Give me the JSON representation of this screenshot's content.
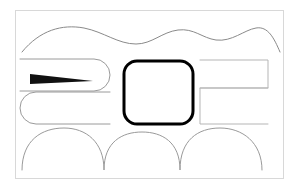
{
  "document": {
    "title": "Abstract Line Art Illustration",
    "width": 298,
    "height": 187,
    "background_color": "#ffffff"
  },
  "frame": {
    "name": "outer-border",
    "x": 15,
    "y": 10,
    "width": 268,
    "height": 168,
    "stroke_color": "#d8d8d8",
    "stroke_width": 1,
    "fill": "none"
  },
  "palette": {
    "thin_line": "#7a7a7a",
    "light_line": "#c9c9c9",
    "bold_line": "#000000",
    "solid_fill": "#111111",
    "frame": "#d8d8d8",
    "page": "#ffffff"
  },
  "shapes": [
    {
      "id": "top-wave",
      "label": "top wavy line",
      "type": "path",
      "stroke": "#8a8a8a",
      "stroke_width": 1,
      "fill": "none",
      "d": "M 22 52 C 40 30 62 24 84 28 C 104 32 118 44 136 44 C 152 44 162 32 178 30 C 194 28 202 38 216 40 C 232 42 244 30 256 28 C 268 26 274 38 280 52"
    },
    {
      "id": "left-upper-stadium",
      "label": "upper left rounded bar",
      "type": "path",
      "stroke": "#9a9a9a",
      "stroke_width": 1,
      "fill": "none",
      "d": "M 20 59 L 94 59 A 16 16 0 0 1 94 91 L 20 91"
    },
    {
      "id": "left-lower-stadium",
      "label": "lower left rounded bar",
      "type": "path",
      "stroke": "#9a9a9a",
      "stroke_width": 1,
      "fill": "none",
      "d": "M 110 92 L 36 92 A 16 16 0 0 0 36 124 L 110 124"
    },
    {
      "id": "black-wedge",
      "label": "solid black tapered wedge pointing right",
      "type": "polygon",
      "fill": "#111111",
      "stroke": "none",
      "points": "30,74 30,84 93,81"
    },
    {
      "id": "center-rounded-rect",
      "label": "central bold rounded rectangle",
      "type": "rounded-rect",
      "x": 124,
      "y": 61,
      "width": 69,
      "height": 63,
      "rx": 13,
      "stroke": "#000000",
      "stroke_width": 3,
      "fill": "#ffffff"
    },
    {
      "id": "right-upper-bracket",
      "label": "upper right rectangular bracket",
      "type": "path",
      "stroke": "#b5b5b5",
      "stroke_width": 1,
      "fill": "none",
      "d": "M 200 60 L 268 60 L 268 88 L 200 88"
    },
    {
      "id": "right-lower-bracket",
      "label": "lower right rectangular bracket",
      "type": "path",
      "stroke": "#b5b5b5",
      "stroke_width": 1,
      "fill": "none",
      "d": "M 268 88 L 200 88 L 200 124 L 268 124"
    },
    {
      "id": "bottom-scallop",
      "label": "bottom scalloped wave line",
      "type": "path",
      "stroke": "#9a9a9a",
      "stroke_width": 1,
      "fill": "none",
      "d": "M 22 170 C 22 140 42 128 64 128 C 86 128 104 142 104 170 C 104 142 122 132 142 132 C 162 132 180 142 180 170 C 180 140 198 128 220 128 C 242 128 262 142 262 170"
    }
  ]
}
